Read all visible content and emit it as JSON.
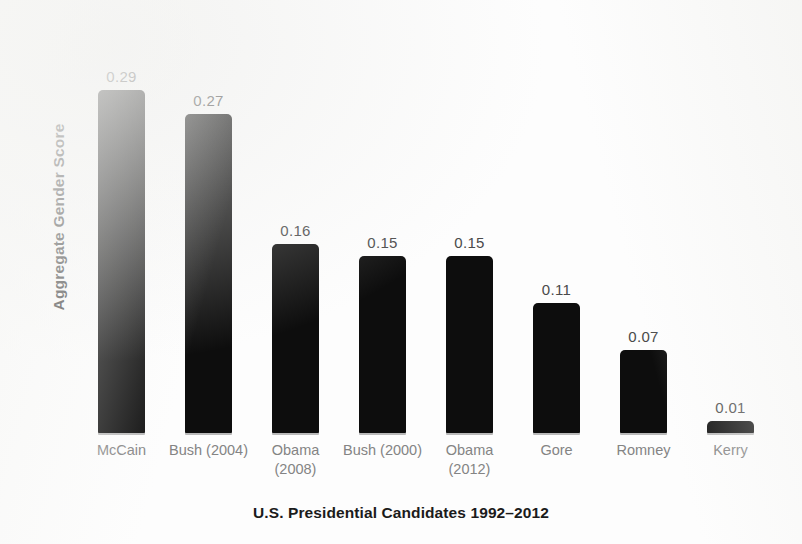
{
  "chart_data": {
    "type": "bar",
    "title": "",
    "xlabel": "U.S. Presidential Candidates 1992–2012",
    "ylabel": "Aggregate Gender Score",
    "categories": [
      "McCain",
      "Bush (2004)",
      "Obama (2008)",
      "Bush (2000)",
      "Obama (2012)",
      "Gore",
      "Romney",
      "Kerry"
    ],
    "category_lines": [
      [
        "McCain",
        ""
      ],
      [
        "Bush (2004)",
        ""
      ],
      [
        "Obama",
        "(2008)"
      ],
      [
        "Bush (2000)",
        ""
      ],
      [
        "Obama",
        "(2012)"
      ],
      [
        "Gore",
        ""
      ],
      [
        "Romney",
        ""
      ],
      [
        "Kerry",
        ""
      ]
    ],
    "values": [
      0.29,
      0.27,
      0.16,
      0.15,
      0.15,
      0.11,
      0.07,
      0.01
    ],
    "value_labels": [
      "0.29",
      "0.27",
      "0.16",
      "0.15",
      "0.15",
      "0.11",
      "0.07",
      "0.01"
    ],
    "ylim": [
      0,
      0.29
    ],
    "grid": false,
    "legend": false,
    "y_tick_labels": [],
    "x_tick_labels": [
      "McCain",
      "Bush (2004)",
      "Obama (2008)",
      "Bush (2000)",
      "Obama (2012)",
      "Gore",
      "Romney",
      "Kerry"
    ],
    "bar_color": "#0d0d0d",
    "value_label_color": "#4a4a4a",
    "category_label_color": "#848484",
    "axis_title_color": "#1b1b1b",
    "background_color": "#fdfdfd"
  }
}
